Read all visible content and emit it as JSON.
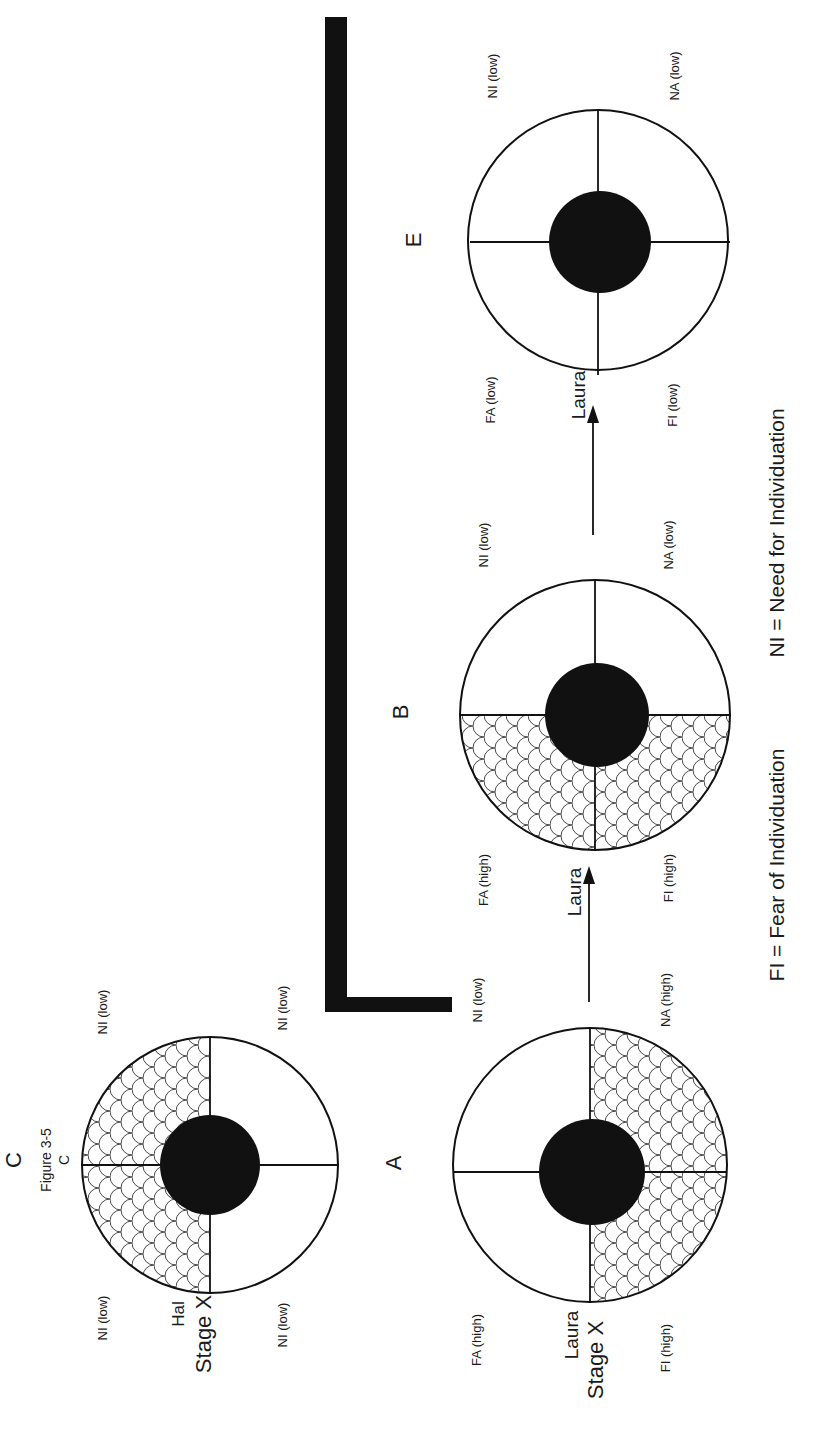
{
  "figure": {
    "title": "Figure 3-5",
    "subtitle": "C",
    "panel_label_top": "C"
  },
  "panels": {
    "C": {
      "label": "C",
      "person": "Hal",
      "stage": "Stage X",
      "quadrants": {
        "top_left": "NI (low)",
        "bottom_left": "NI (low)",
        "top_right": "NI (low)",
        "bottom_right": "NI (low)"
      },
      "hatched": "left-half"
    },
    "A": {
      "label": "A",
      "person": "Laura",
      "stage": "Stage X",
      "quadrants": {
        "top_left": "FA (high)",
        "bottom_left": "FI (high)",
        "top_right": "NI (low)",
        "bottom_right": "NA (high)"
      },
      "hatched": "right-half"
    },
    "B": {
      "label": "B",
      "arrow_label": "Laura",
      "quadrants": {
        "top_left": "FA (high)",
        "bottom_left": "FI (high)",
        "top_right": "NI (low)",
        "bottom_right": "NA (low)"
      },
      "hatched": "left-half"
    },
    "E": {
      "label": "E",
      "arrow_label": "Laura",
      "quadrants": {
        "top_left": "FA (low)",
        "bottom_left": "FI (low)",
        "top_right": "NI (low)",
        "bottom_right": "NA (low)"
      },
      "hatched": "none"
    }
  },
  "legend": {
    "fi": "FI = Fear of Individuation",
    "ni": "NI = Need for Individuation"
  },
  "colors": {
    "ink": "#111111",
    "background": "#ffffff"
  }
}
